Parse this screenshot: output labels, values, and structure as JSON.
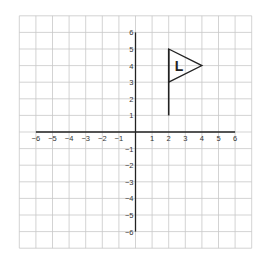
{
  "chart_data": {
    "type": "scatter",
    "title": "",
    "xlabel": "",
    "ylabel": "",
    "xlim": [
      -7,
      7
    ],
    "ylim": [
      -7,
      7
    ],
    "grid": true,
    "x_ticks": [
      "-6",
      "-5",
      "-4",
      "-3",
      "-2",
      "-1",
      "1",
      "2",
      "3",
      "4",
      "5",
      "6"
    ],
    "y_ticks": [
      "6",
      "5",
      "4",
      "3",
      "2",
      "1",
      "-1",
      "-2",
      "-3",
      "-4",
      "-5",
      "-6"
    ],
    "shapes": [
      {
        "name": "flag-pole",
        "type": "line",
        "points": [
          [
            2,
            1
          ],
          [
            2,
            5
          ]
        ]
      },
      {
        "name": "flag-triangle",
        "type": "polygon",
        "points": [
          [
            2,
            5
          ],
          [
            4,
            4
          ],
          [
            2,
            3
          ]
        ]
      }
    ],
    "annotations": [
      {
        "text": "L",
        "x": 2.6,
        "y": 4
      }
    ]
  },
  "colors": {
    "grid": "#c8c8c8",
    "axis": "#222222",
    "shape": "#222222"
  }
}
